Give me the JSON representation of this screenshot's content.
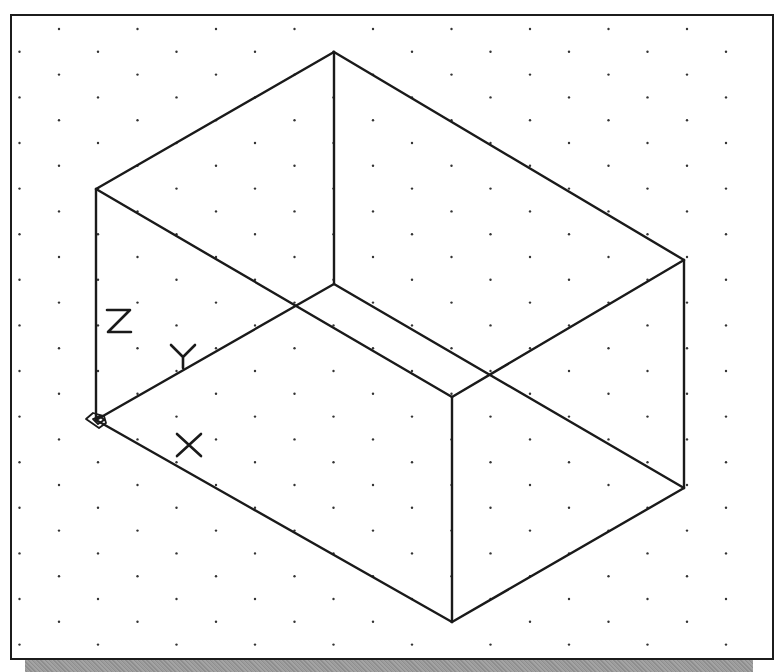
{
  "drawing": {
    "title": "Isometric wireframe box with UCS icon",
    "grid": {
      "type": "isometric-dot-grid",
      "dot_color": "#333333",
      "col_spacing": 78.5,
      "row_spacing": 22.8,
      "first_row_y": 29,
      "even_row_start_x": 59,
      "odd_row_start_x": 19.5,
      "rows": 28
    },
    "line_color": "#1a1a1a",
    "vertices": {
      "top_left": [
        96,
        189
      ],
      "top_back": [
        334,
        52
      ],
      "top_right": [
        684,
        260
      ],
      "top_front": [
        452,
        397
      ],
      "bottom_left": [
        96,
        420
      ],
      "bottom_back": [
        334,
        284
      ],
      "bottom_right": [
        684,
        488
      ],
      "bottom_front": [
        452,
        622
      ]
    },
    "edges": [
      [
        "top_left",
        "top_back"
      ],
      [
        "top_back",
        "top_right"
      ],
      [
        "top_right",
        "top_front"
      ],
      [
        "top_front",
        "top_left"
      ],
      [
        "top_left",
        "bottom_left"
      ],
      [
        "top_back",
        "bottom_back"
      ],
      [
        "top_right",
        "bottom_right"
      ],
      [
        "top_front",
        "bottom_front"
      ],
      [
        "bottom_left",
        "bottom_back"
      ],
      [
        "bottom_back",
        "bottom_right"
      ],
      [
        "bottom_right",
        "bottom_front"
      ],
      [
        "bottom_front",
        "bottom_left"
      ]
    ],
    "ucs_icon": {
      "origin": [
        96,
        420
      ],
      "labels": {
        "z": "Z",
        "y": "Y",
        "x": "X"
      }
    }
  }
}
